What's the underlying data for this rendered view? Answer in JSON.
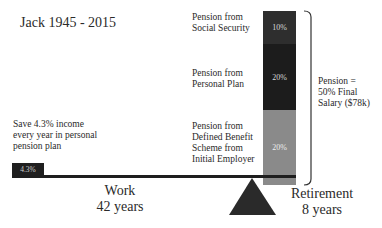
{
  "title": "Jack 1945 - 2015",
  "save_note": {
    "lines": [
      "Save 4.3% income",
      "every year in personal",
      "pension plan"
    ],
    "bar_label": "4.3%"
  },
  "pension_sources": [
    {
      "lines": [
        "Pension from",
        "Social Security"
      ],
      "percent": "10%",
      "color": "#2e2e2e"
    },
    {
      "lines": [
        "Pension from",
        "Personal Plan"
      ],
      "percent": "20%",
      "color": "#1c1c1c"
    },
    {
      "lines": [
        "Pension from",
        "Defined Benefit",
        "Scheme from",
        "Initial Employer"
      ],
      "percent": "20%",
      "color": "#8a8a8a"
    }
  ],
  "total": {
    "lines": [
      "Pension =",
      "50% Final",
      "Salary ($78k)"
    ]
  },
  "phases": {
    "work": {
      "label": "Work",
      "duration": "42 years"
    },
    "retirement": {
      "label": "Retirement",
      "duration": "8 years"
    }
  }
}
